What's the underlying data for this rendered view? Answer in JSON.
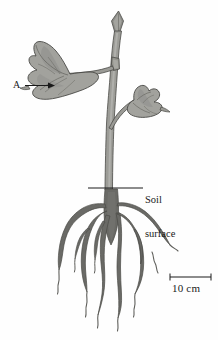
{
  "figure": {
    "background_color": "#fefefe",
    "width": 218,
    "height": 340
  },
  "labels": {
    "callout_a": "A",
    "soil_surface_line1": "Soil",
    "soil_surface_line2": "surface",
    "scale_bar": "10 cm"
  },
  "colors": {
    "shoot_fill": "#9c9c97",
    "shoot_fill_light": "#aaaaa5",
    "leaf_fill": "#a2a29d",
    "leaf_fill_dark": "#90908b",
    "root_fill": "#6a6a66",
    "outline": "#4a4a46",
    "ink": "#1a1a1a"
  },
  "scale": {
    "value": 10,
    "unit": "cm",
    "bar_left_x": 170,
    "bar_right_x": 211,
    "bar_y": 277
  },
  "annotations": {
    "arrow_a": {
      "semantic": "leader-arrow-pointing-to-leaf",
      "from_x": 25,
      "to_x": 52,
      "y": 85
    },
    "soil_line": {
      "semantic": "horizontal-soil-surface-line",
      "from_x": 88,
      "to_x": 143,
      "y": 188
    }
  },
  "parts": {
    "apex_bud": "terminal-bud",
    "axillary_bud": "axillary-bud",
    "left_leaf": "leaf-left",
    "right_leaf": "leaf-right",
    "stem": "stem",
    "taproot": "taproot",
    "lateral_roots": "lateral-roots"
  }
}
